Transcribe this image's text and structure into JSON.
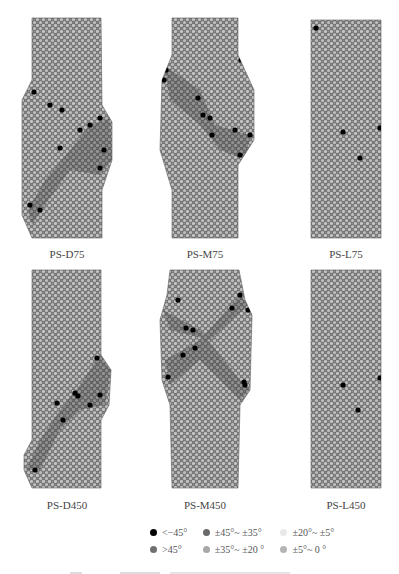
{
  "figure": {
    "panels": [
      {
        "id": "PS-D75",
        "label": "PS-D75",
        "row": 0,
        "col": 0,
        "outline": "M32,18 L101,18 L102,105 L112,122 L112,160 L102,190 L102,238 L32,238 L22,215 L22,100 L32,80 Z",
        "dark_clusters": [
          [
            34,
            92
          ],
          [
            50,
            105
          ],
          [
            62,
            110
          ],
          [
            80,
            130
          ],
          [
            90,
            125
          ],
          [
            100,
            118
          ],
          [
            104,
            150
          ],
          [
            100,
            168
          ],
          [
            60,
            148
          ],
          [
            30,
            205
          ],
          [
            40,
            210
          ]
        ],
        "band": "M28,210 L45,180 L70,150 L90,125 L110,118 L112,160 L100,175 L70,170 L45,205 L32,225 Z"
      },
      {
        "id": "PS-M75",
        "label": "PS-M75",
        "row": 0,
        "col": 1,
        "outline": "M172,18 L238,18 L238,55 L254,90 L254,140 L238,165 L238,238 L172,238 L172,190 L160,150 L162,80 L172,55 Z",
        "dark_clusters": [
          [
            166,
            70
          ],
          [
            164,
            80
          ],
          [
            198,
            98
          ],
          [
            203,
            115
          ],
          [
            210,
            118
          ],
          [
            212,
            135
          ],
          [
            235,
            130
          ],
          [
            250,
            135
          ],
          [
            245,
            160
          ],
          [
            240,
            155
          ],
          [
            241,
            60
          ]
        ],
        "band": "M164,65 L200,90 L215,125 L250,135 L246,160 L220,150 L200,125 L170,100 Z"
      },
      {
        "id": "PS-L75",
        "label": "PS-L75",
        "row": 0,
        "col": 2,
        "outline": "M311,20 L381,20 L381,238 L311,238 Z",
        "dark_clusters": [
          [
            316,
            28
          ],
          [
            380,
            128
          ],
          [
            360,
            158
          ],
          [
            343,
            132
          ]
        ],
        "band": ""
      },
      {
        "id": "PS-D450",
        "label": "PS-D450",
        "row": 1,
        "col": 0,
        "outline": "M32,270 L101,270 L101,355 L111,370 L109,405 L101,420 L101,488 L32,488 L24,470 L24,455 L32,440 Z",
        "dark_clusters": [
          [
            97,
            358
          ],
          [
            75,
            393
          ],
          [
            78,
            396
          ],
          [
            100,
            395
          ],
          [
            57,
            403
          ],
          [
            63,
            420
          ],
          [
            90,
            405
          ],
          [
            35,
            470
          ]
        ],
        "band": "M26,470 L40,440 L60,410 L80,385 L100,355 L111,370 L105,405 L80,410 L60,430 L40,470 Z"
      },
      {
        "id": "PS-M450",
        "label": "PS-M450",
        "row": 1,
        "col": 1,
        "outline": "M170,270 L239,270 L245,300 L252,315 L250,390 L240,405 L238,488 L172,488 L170,405 L162,380 L160,320 L167,295 Z",
        "dark_clusters": [
          [
            178,
            300
          ],
          [
            186,
            328
          ],
          [
            193,
            330
          ],
          [
            240,
            295
          ],
          [
            232,
            308
          ],
          [
            248,
            310
          ],
          [
            195,
            348
          ],
          [
            183,
            355
          ],
          [
            168,
            377
          ],
          [
            245,
            385
          ],
          [
            244,
            382
          ]
        ],
        "band": "M163,310 L200,330 L240,380 L250,390 L240,400 L200,360 L170,385 L165,360 L200,340 L240,295 L248,305 L210,340 L170,330 Z"
      },
      {
        "id": "PS-L450",
        "label": "PS-L450",
        "row": 1,
        "col": 2,
        "outline": "M311,270 L381,270 L381,488 L311,488 Z",
        "dark_clusters": [
          [
            380,
            378
          ],
          [
            358,
            410
          ],
          [
            343,
            385
          ]
        ],
        "band": ""
      }
    ],
    "legend": {
      "rows": [
        [
          {
            "label": "<−45°",
            "color": "#000000"
          },
          {
            "label": "±45°~ ±35°",
            "color": "#6a6a6a"
          },
          {
            "label": "±20°~ ±5°",
            "color": "#e8e8e8"
          }
        ],
        [
          {
            "label": ">45°",
            "color": "#707070"
          },
          {
            "label": "±35°~ ±20 °",
            "color": "#a8a8a8"
          },
          {
            "label": "±5°~ 0 °",
            "color": "#b4b4b4"
          }
        ]
      ]
    },
    "colors": {
      "particle_base": "#7a7a7a",
      "particle_light": "#c8c8c8",
      "particle_dark": "#4a4a4a",
      "cluster": "#000000"
    }
  }
}
